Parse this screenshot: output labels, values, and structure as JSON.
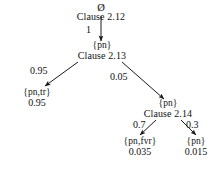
{
  "diagram": {
    "type": "probabilistic-derivation-tree",
    "background_color": "#ffffff",
    "text_color": "#111111",
    "nodes": {
      "root": {
        "set_label": "Ø",
        "clause_label": "Clause 2.12"
      },
      "level1": {
        "set_label": "{pn}",
        "clause_label": "Clause 2.13"
      },
      "leaf_left": {
        "set_label": "{pn,tr}",
        "probability": "0.95"
      },
      "level2": {
        "set_label": "{pn}",
        "clause_label": "Clause 2.14"
      },
      "leaf_mid": {
        "set_label": "{pn,fvr}",
        "probability": "0.035"
      },
      "leaf_right": {
        "set_label": "{pn}",
        "probability": "0.015"
      }
    },
    "edges": {
      "root_to_level1": "1",
      "level1_to_leaf_left": "0.95",
      "level1_to_level2": "0.05",
      "level2_to_leaf_mid": "0.7",
      "level2_to_leaf_right": "0.3"
    }
  }
}
